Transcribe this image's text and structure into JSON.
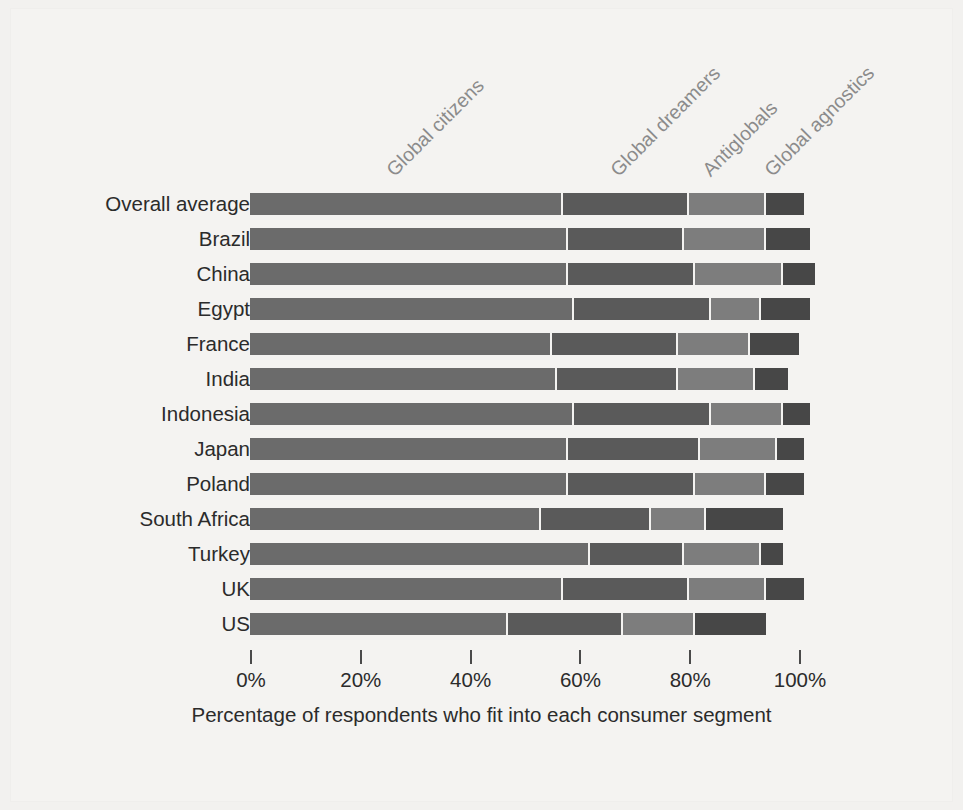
{
  "chart_data": {
    "type": "bar",
    "orientation": "horizontal",
    "stacked": true,
    "title": "",
    "xlabel": "Percentage of respondents who fit into each consumer segment",
    "ylabel": "",
    "xlim": [
      0,
      100
    ],
    "grid": false,
    "legend_position": "top-rotated-labels",
    "x_ticks": [
      "0%",
      "20%",
      "40%",
      "60%",
      "80%",
      "100%"
    ],
    "x_tick_values": [
      0,
      20,
      40,
      60,
      80,
      100
    ],
    "categories": [
      "Overall average",
      "Brazil",
      "China",
      "Egypt",
      "France",
      "India",
      "Indonesia",
      "Japan",
      "Poland",
      "South Africa",
      "Turkey",
      "UK",
      "US"
    ],
    "series": [
      {
        "name": "Global citizens",
        "color": "#6b6b6b",
        "values": [
          57,
          58,
          58,
          59,
          55,
          56,
          59,
          58,
          58,
          53,
          62,
          57,
          47
        ]
      },
      {
        "name": "Global dreamers",
        "color": "#5a5a5a",
        "values": [
          23,
          21,
          23,
          25,
          23,
          22,
          25,
          24,
          23,
          20,
          17,
          23,
          21
        ]
      },
      {
        "name": "Antiglobals",
        "color": "#7d7d7d",
        "values": [
          14,
          15,
          16,
          9,
          13,
          14,
          13,
          14,
          13,
          10,
          14,
          14,
          13
        ]
      },
      {
        "name": "Global agnostics",
        "color": "#474747",
        "values": [
          7,
          8,
          6,
          9,
          9,
          6,
          5,
          5,
          7,
          14,
          4,
          7,
          13
        ]
      }
    ]
  },
  "axis_caption": "Percentage of respondents who fit into each consumer segment",
  "segment_labels": [
    "Global citizens",
    "Global dreamers",
    "Antiglobals",
    "Global agnostics"
  ],
  "colors": {
    "background": "#f4f3f1",
    "text": "#2b2b2b",
    "label_gray": "#8b8b8b",
    "segment_1": "#6b6b6b",
    "segment_2": "#5a5a5a",
    "segment_3": "#7d7d7d",
    "segment_4": "#474747"
  }
}
